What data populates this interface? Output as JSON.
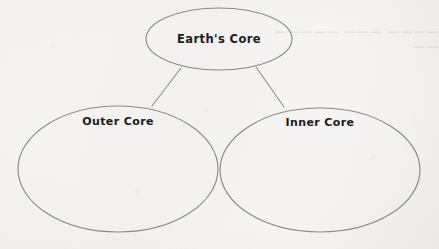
{
  "page": {
    "kind": "scanned-worksheet-concept-map",
    "background_color": "#f5f4f2",
    "ink_color": "#1b1b1b",
    "outline_color": "#8d8d8d"
  },
  "diagram": {
    "type": "concept-map",
    "root": {
      "label": "Earth's Core",
      "shape": "ellipse",
      "center_x": 219,
      "center_y": 39,
      "radius_x": 73,
      "radius_y": 31
    },
    "children": [
      {
        "label": "Outer Core",
        "shape": "ellipse",
        "center_x": 118,
        "center_y": 169,
        "radius_x": 100,
        "radius_y": 63,
        "label_x": 118,
        "label_y": 121,
        "body_blank": true
      },
      {
        "label": "Inner Core",
        "shape": "ellipse",
        "center_x": 320,
        "center_y": 170,
        "radius_x": 100,
        "radius_y": 62,
        "label_x": 320,
        "label_y": 122,
        "body_blank": true
      }
    ],
    "connectors": [
      {
        "name": "root-to-outer-core",
        "x1": 181,
        "y1": 68,
        "x2": 152,
        "y2": 106
      },
      {
        "name": "root-to-inner-core",
        "x1": 256,
        "y1": 67,
        "x2": 284,
        "y2": 107
      }
    ]
  },
  "artifacts": {
    "bleed_through_line_1": "———— ——— ————— ——",
    "bleed_through_line_2": "——— ———— ———"
  }
}
